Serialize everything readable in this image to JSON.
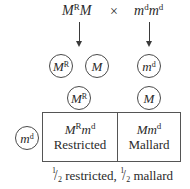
{
  "cross": {
    "parent1": {
      "base1": "M",
      "sup1": "R",
      "base2": "M",
      "sup2": ""
    },
    "operator": "×",
    "parent2": {
      "base1": "m",
      "sup1": "d",
      "base2": "m",
      "sup2": "d"
    }
  },
  "gametes_row1": [
    {
      "base": "M",
      "sup": "R"
    },
    {
      "base": "M",
      "sup": ""
    },
    {
      "base": "m",
      "sup": "d"
    }
  ],
  "gametes_row2": [
    {
      "base": "M",
      "sup": "R"
    },
    {
      "base": "M",
      "sup": ""
    }
  ],
  "punnett": {
    "row_gamete": {
      "base": "m",
      "sup": "d"
    },
    "cells": [
      {
        "genotype": {
          "base1": "M",
          "sup1": "R",
          "base2": "m",
          "sup2": "d"
        },
        "phenotype": "Restricted"
      },
      {
        "genotype": {
          "base1": "M",
          "sup1": "",
          "base2": "m",
          "sup2": "d"
        },
        "phenotype": "Mallard"
      }
    ]
  },
  "caption": {
    "frac1_num": "1",
    "frac1_den": "2",
    "text1": " restricted, ",
    "frac2_num": "1",
    "frac2_den": "2",
    "text2": " mallard"
  },
  "colors": {
    "ink": "#2a2a2a",
    "lines": "#555555"
  }
}
